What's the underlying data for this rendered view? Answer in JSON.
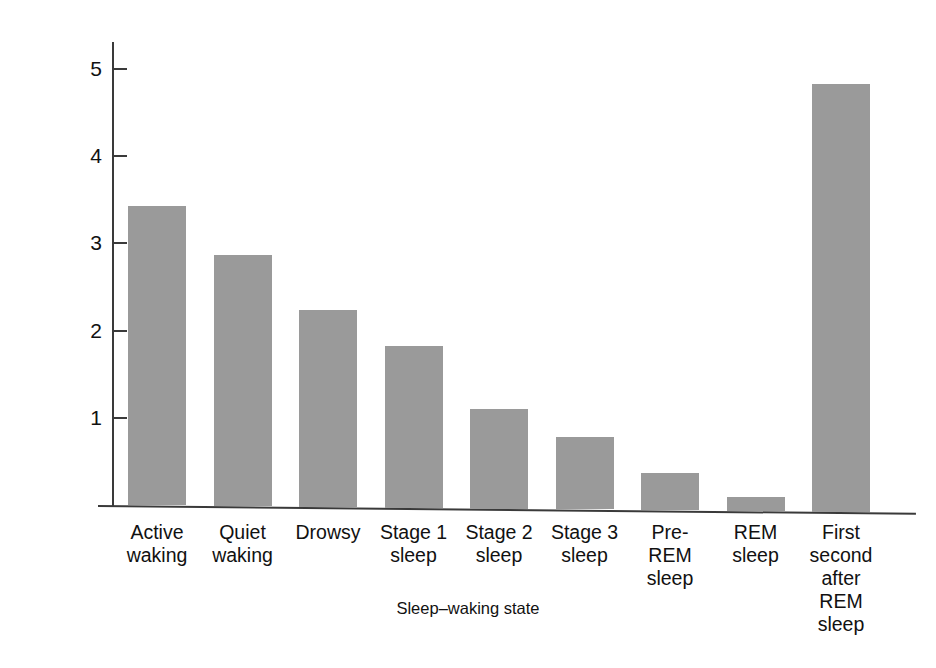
{
  "chart_data": {
    "type": "bar",
    "title": "",
    "xlabel": "Sleep–waking state",
    "ylabel": "Mean firing rate (spikes/sec)",
    "categories": [
      "Active\nwaking",
      "Quiet\nwaking",
      "Drowsy",
      "Stage 1\nsleep",
      "Stage 2\nsleep",
      "Stage 3\nsleep",
      "Pre-\nREM\nsleep",
      "REM\nsleep",
      "First\nsecond\nafter\nREM\nsleep"
    ],
    "values": [
      3.43,
      2.88,
      2.26,
      1.85,
      1.14,
      0.83,
      0.43,
      0.16,
      4.91
    ],
    "ylim": [
      0,
      5.4
    ],
    "yticks": [
      1,
      2,
      3,
      4,
      5
    ],
    "ytick_labels": [
      "1",
      "2",
      "3",
      "4",
      "5"
    ],
    "grid": false,
    "legend": false,
    "bar_color": "#9a9a9a",
    "axis_color": "#3a3a3a",
    "background": "#ffffff"
  }
}
